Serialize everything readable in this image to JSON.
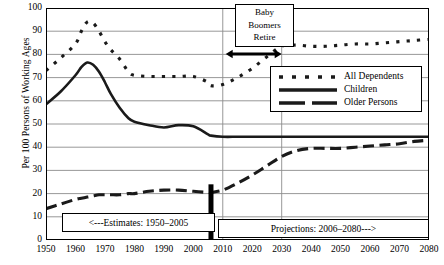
{
  "chart_data": {
    "type": "line",
    "title": "",
    "xlabel": "",
    "ylabel": "Per 100 Persons of Working Ages",
    "xlim": [
      1950,
      2080
    ],
    "ylim": [
      0,
      100
    ],
    "ytick_labels": [
      "0",
      "10",
      "20",
      "30",
      "40",
      "50",
      "60",
      "70",
      "80",
      "90",
      "100"
    ],
    "ytick_values": [
      0,
      10,
      20,
      30,
      40,
      50,
      60,
      70,
      80,
      90,
      100
    ],
    "xtick_labels": [
      "1950",
      "1960",
      "1970",
      "1980",
      "1990",
      "2000",
      "2010",
      "2020",
      "2030",
      "2040",
      "2050",
      "2060",
      "2070",
      "2080"
    ],
    "xtick_values": [
      1950,
      1960,
      1970,
      1980,
      1990,
      2000,
      2010,
      2020,
      2030,
      2040,
      2050,
      2060,
      2070,
      2080
    ],
    "minor_xtick_step": 5,
    "grid": "horizontal",
    "legend_position": "upper right",
    "series": [
      {
        "name": "All Dependents",
        "style": "dotted",
        "x": [
          1950,
          1955,
          1960,
          1962,
          1964,
          1966,
          1968,
          1970,
          1972,
          1975,
          1978,
          1980,
          1985,
          1990,
          1995,
          2000,
          2005,
          2006,
          2010,
          2015,
          2020,
          2025,
          2030,
          2035,
          2040,
          2045,
          2050,
          2055,
          2060,
          2065,
          2070,
          2075,
          2080
        ],
        "values": [
          73,
          78.5,
          84.5,
          90,
          94,
          93.5,
          90,
          85.5,
          82,
          78,
          72.5,
          71,
          70.5,
          70.5,
          70.5,
          70.5,
          68,
          66.5,
          67,
          70,
          74,
          79,
          83.5,
          84,
          83.5,
          83.5,
          84,
          84.5,
          84.5,
          85,
          85.5,
          86,
          86.5
        ]
      },
      {
        "name": "Children",
        "style": "solid",
        "x": [
          1950,
          1955,
          1960,
          1962,
          1964,
          1966,
          1968,
          1970,
          1972,
          1975,
          1978,
          1980,
          1985,
          1990,
          1995,
          2000,
          2005,
          2006,
          2010,
          2015,
          2020,
          2025,
          2030,
          2035,
          2040,
          2045,
          2050,
          2055,
          2060,
          2065,
          2070,
          2075,
          2080
        ],
        "values": [
          58.5,
          64,
          71,
          74.5,
          76.5,
          75.5,
          72.5,
          68,
          63,
          57,
          52.5,
          51,
          49.5,
          48.5,
          49.5,
          49,
          45.5,
          45,
          44.5,
          44.5,
          44.5,
          44.5,
          44.5,
          44.5,
          44.5,
          44.5,
          44.5,
          44.5,
          44.5,
          44.5,
          44.5,
          44.5,
          44.5
        ]
      },
      {
        "name": "Older Persons",
        "style": "dashed",
        "x": [
          1950,
          1955,
          1960,
          1962,
          1964,
          1966,
          1968,
          1970,
          1972,
          1975,
          1978,
          1980,
          1985,
          1990,
          1995,
          2000,
          2005,
          2006,
          2010,
          2015,
          2020,
          2025,
          2030,
          2035,
          2040,
          2045,
          2050,
          2055,
          2060,
          2065,
          2070,
          2075,
          2080
        ],
        "values": [
          13.5,
          15.5,
          17.5,
          18,
          18.5,
          19,
          19.5,
          19.5,
          19.5,
          19.5,
          20,
          20,
          21,
          21.5,
          21.5,
          21,
          20.5,
          20.5,
          21.5,
          24.5,
          28,
          32,
          36,
          38.5,
          39.5,
          39.5,
          39.5,
          40,
          40.5,
          41,
          41.5,
          42.5,
          43
        ]
      }
    ],
    "annotations": [
      {
        "name": "baby-boomers-retire",
        "text": [
          "Baby",
          "Boomers",
          "Retire"
        ],
        "x_start": 2011,
        "x_end": 2030
      },
      {
        "name": "estimates-range",
        "text": "<---Estimates: 1950–2005"
      },
      {
        "name": "projections-range",
        "text": "Projections: 2006–2080--->"
      }
    ],
    "divider_year": 2006
  },
  "legend": {
    "items": [
      {
        "label": "All Dependents",
        "style": "dotted"
      },
      {
        "label": "Children",
        "style": "solid"
      },
      {
        "label": "Older Persons",
        "style": "dashed"
      }
    ]
  },
  "colors": {
    "line": "#1a1a1a",
    "grid": "#8c8c8c",
    "axis": "#000000",
    "background": "#ffffff"
  }
}
